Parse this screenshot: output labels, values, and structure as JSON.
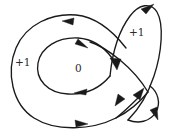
{
  "figure": {
    "kind": "immersed-closed-curve-diagram",
    "background_color": "#ffffff",
    "stroke_color": "#1a1a1a",
    "width": 172,
    "height": 136,
    "regions": [
      {
        "id": "left",
        "label": "+1",
        "x": 15,
        "y": 57
      },
      {
        "id": "center",
        "label": "0",
        "x": 75,
        "y": 63
      },
      {
        "id": "right",
        "label": "+1",
        "x": 129,
        "y": 27
      }
    ],
    "arrow_count": 9,
    "arrows": [
      {
        "id": "top-outer-arc",
        "direction": "left",
        "x": 70,
        "y": 22
      },
      {
        "id": "inner-loop-top",
        "direction": "right-down",
        "x": 80,
        "y": 45
      },
      {
        "id": "inner-loop-bottom",
        "direction": "left",
        "x": 82,
        "y": 90
      },
      {
        "id": "bottom-outer-arc",
        "direction": "right",
        "x": 78,
        "y": 122
      },
      {
        "id": "right-loop-top",
        "direction": "up-right",
        "x": 148,
        "y": 8
      },
      {
        "id": "right-upper-cross",
        "direction": "down",
        "x": 115,
        "y": 63
      },
      {
        "id": "lower-v-left",
        "direction": "down-left",
        "x": 121,
        "y": 101
      },
      {
        "id": "lower-v-right",
        "direction": "up-right",
        "x": 139,
        "y": 94
      },
      {
        "id": "right-lower-tip",
        "direction": "down-right",
        "x": 155,
        "y": 113
      }
    ]
  }
}
